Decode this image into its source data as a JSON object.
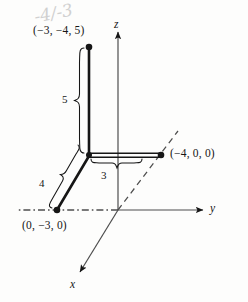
{
  "figure": {
    "background_color": "#fdfdfc",
    "ink_color": "#161616",
    "pencil_color": "#c9c9c9",
    "annotation": {
      "text": "-4/-3",
      "style": "faint handwritten pencil mark above the top point label"
    }
  },
  "axes": [
    {
      "name": "x",
      "label": "x",
      "style": "solid below origin, dashed above origin",
      "arrow": "down-left"
    },
    {
      "name": "y",
      "label": "y",
      "style": "solid right of origin, dash-dot left of origin",
      "arrow": "right"
    },
    {
      "name": "z",
      "label": "z",
      "style": "solid above origin",
      "arrow": "up"
    }
  ],
  "points": [
    {
      "id": "top",
      "label": "(−3, −4, 5)",
      "coords": [
        -3,
        -4,
        5
      ]
    },
    {
      "id": "right",
      "label": "(−4, 0, 0)",
      "coords": [
        -4,
        0,
        0
      ]
    },
    {
      "id": "bottom",
      "label": "(0, −3, 0)",
      "coords": [
        0,
        -3,
        0
      ]
    }
  ],
  "segments": [
    {
      "id": "vertical",
      "length_label": "5",
      "brace": "left"
    },
    {
      "id": "horizontal",
      "length_label": "3",
      "brace": "below"
    },
    {
      "id": "slant",
      "length_label": "4",
      "brace": "left"
    }
  ]
}
